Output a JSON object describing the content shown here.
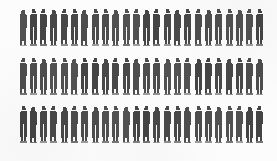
{
  "figure": {
    "type": "pictogram",
    "icon_name": "person-silhouette-icon",
    "background_color": "#fcfcfc",
    "icon_color": "#3a3a3a",
    "caption": ""
  },
  "chart_data": {
    "type": "pictogram",
    "title": "",
    "subtitle": "",
    "xlabel": "",
    "ylabel": "",
    "unit_symbol": "person",
    "unit_value": 1,
    "icon_color": "#3a3a3a",
    "background_color": "#fcfcfc",
    "grid": false,
    "legend": false,
    "legend_position": "none",
    "axis_visible": false,
    "tick_labels": [],
    "annotations": [],
    "categories": [
      "Row 1",
      "Row 2",
      "Row 3"
    ],
    "values": [
      24,
      24,
      24
    ],
    "total": 72,
    "rows": [
      {
        "label": "Row 1",
        "count": 24
      },
      {
        "label": "Row 2",
        "count": 24
      },
      {
        "label": "Row 3",
        "count": 24
      }
    ]
  }
}
